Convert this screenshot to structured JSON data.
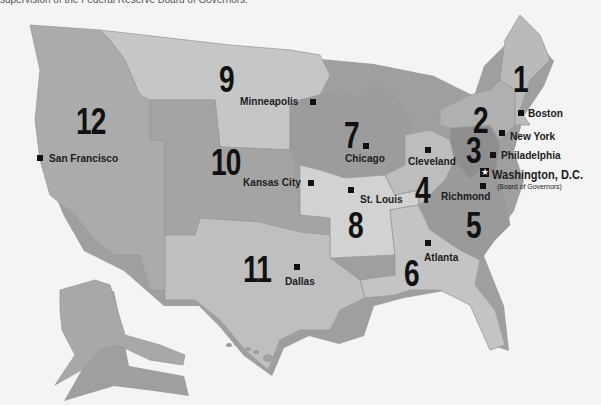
{
  "caption": "supervision of the Federal Reserve Board of Governors.",
  "colors": {
    "background": "#f4f4f4",
    "district_light": "#c8c8c8",
    "district_mid": "#b4b4b4",
    "district_dark": "#9c9c9c",
    "district_darker": "#8e8e8e",
    "text": "#111111"
  },
  "districts": [
    {
      "number": "1",
      "bank_city": "Boston"
    },
    {
      "number": "2",
      "bank_city": "New York"
    },
    {
      "number": "3",
      "bank_city": "Philadelphia"
    },
    {
      "number": "4",
      "bank_city": "Cleveland"
    },
    {
      "number": "5",
      "bank_city": "Richmond"
    },
    {
      "number": "6",
      "bank_city": "Atlanta"
    },
    {
      "number": "7",
      "bank_city": "Chicago"
    },
    {
      "number": "8",
      "bank_city": "St. Louis"
    },
    {
      "number": "9",
      "bank_city": "Minneapolis"
    },
    {
      "number": "10",
      "bank_city": "Kansas City"
    },
    {
      "number": "11",
      "bank_city": "Dallas"
    },
    {
      "number": "12",
      "bank_city": "San Francisco"
    }
  ],
  "headquarters": {
    "city": "Washington, D.C.",
    "note": "(Board of Governors)",
    "icon": "star-icon"
  },
  "marker_icon": "square-marker-icon"
}
